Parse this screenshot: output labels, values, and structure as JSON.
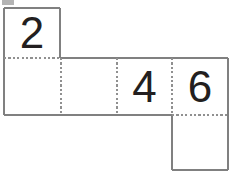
{
  "figure": {
    "background_color": "#ffffff",
    "solid_edge_color": "#808080",
    "fold_edge_color": "#909090",
    "digit_color": "#231f20",
    "artifact_color": "#b4b4b4",
    "square_size_px": 56,
    "stroke_width_px": 1.4,
    "faces": [
      {
        "id": "face-top",
        "label": "2",
        "row": 1,
        "column": 1,
        "x": 4,
        "y": 8,
        "width": 56,
        "height": 50,
        "blank": false
      },
      {
        "id": "face-row2-col1",
        "label": "",
        "row": 2,
        "column": 1,
        "x": 4,
        "y": 58,
        "width": 57,
        "height": 57,
        "blank": true
      },
      {
        "id": "face-row2-col2",
        "label": "",
        "row": 2,
        "column": 2,
        "x": 61,
        "y": 58,
        "width": 56,
        "height": 57,
        "blank": true
      },
      {
        "id": "face-row2-col3",
        "label": "4",
        "row": 2,
        "column": 3,
        "x": 117,
        "y": 58,
        "width": 55,
        "height": 57,
        "blank": false
      },
      {
        "id": "face-row2-col4",
        "label": "6",
        "row": 2,
        "column": 4,
        "x": 172,
        "y": 58,
        "width": 56,
        "height": 57,
        "blank": false
      },
      {
        "id": "face-bottom",
        "label": "",
        "row": 3,
        "column": 4,
        "x": 172,
        "y": 115,
        "width": 56,
        "height": 55,
        "blank": true
      }
    ],
    "solid_edges": [
      {
        "id": "edge-top-square-top",
        "x1": 4,
        "y1": 8,
        "x2": 60,
        "y2": 8
      },
      {
        "id": "edge-top-square-left",
        "x1": 4,
        "y1": 8,
        "x2": 4,
        "y2": 58
      },
      {
        "id": "edge-top-square-right",
        "x1": 60,
        "y1": 8,
        "x2": 60,
        "y2": 58
      },
      {
        "id": "edge-row2-top-right",
        "x1": 60,
        "y1": 58,
        "x2": 228,
        "y2": 58
      },
      {
        "id": "edge-row2-left",
        "x1": 4,
        "y1": 58,
        "x2": 4,
        "y2": 115
      },
      {
        "id": "edge-row2-bottom-left",
        "x1": 4,
        "y1": 115,
        "x2": 172,
        "y2": 115
      },
      {
        "id": "edge-row2-right",
        "x1": 228,
        "y1": 58,
        "x2": 228,
        "y2": 115
      },
      {
        "id": "edge-bottom-square-left",
        "x1": 172,
        "y1": 115,
        "x2": 172,
        "y2": 170
      },
      {
        "id": "edge-bottom-square-right",
        "x1": 228,
        "y1": 115,
        "x2": 228,
        "y2": 170
      },
      {
        "id": "edge-bottom-square-bottom",
        "x1": 172,
        "y1": 170,
        "x2": 228,
        "y2": 170
      }
    ],
    "fold_edges": [
      {
        "id": "fold-horizontal-top-row",
        "x1": 4,
        "y1": 58,
        "x2": 60,
        "y2": 58
      },
      {
        "id": "fold-vertical-1",
        "x1": 61,
        "y1": 58,
        "x2": 61,
        "y2": 115
      },
      {
        "id": "fold-vertical-2",
        "x1": 117,
        "y1": 58,
        "x2": 117,
        "y2": 115
      },
      {
        "id": "fold-vertical-3",
        "x1": 172,
        "y1": 58,
        "x2": 172,
        "y2": 115
      },
      {
        "id": "fold-horizontal-bottom",
        "x1": 172,
        "y1": 115,
        "x2": 228,
        "y2": 115
      }
    ]
  }
}
